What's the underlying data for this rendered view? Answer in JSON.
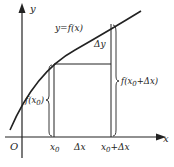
{
  "diagram": {
    "axes": {
      "x_label": "x",
      "y_label": "y",
      "origin_label": "O"
    },
    "curve_label": "y=f(x)",
    "labels": {
      "x0": "x",
      "x0_sub": "0",
      "dx": "Δx",
      "x0dx_main": "x",
      "x0dx_sub": "0",
      "x0dx_tail": "+Δx",
      "dy": "Δy",
      "fx0_pre": "f(x",
      "fx0_sub": "0",
      "fx0_post": ")",
      "fx0dx_pre": "f(x",
      "fx0dx_sub": "0",
      "fx0dx_post": "+Δx)"
    },
    "colors": {
      "line": "#222222",
      "background": "#ffffff"
    }
  }
}
